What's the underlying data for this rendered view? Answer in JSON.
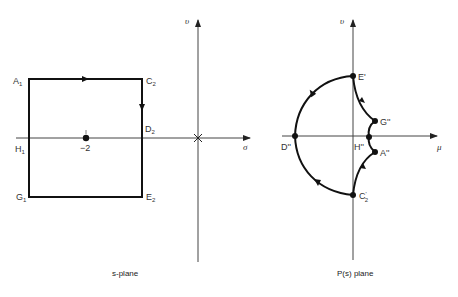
{
  "s_plane": {
    "caption": "s-plane",
    "axes": {
      "horizontal": "σ",
      "vertical": "υ"
    },
    "origin_marker": "×",
    "tick_label": "−2",
    "labels": {
      "A1": {
        "main": "A",
        "sub": "1"
      },
      "C2": {
        "main": "C",
        "sub": "2"
      },
      "D2": {
        "main": "D",
        "sub": "2"
      },
      "H1": {
        "main": "H",
        "sub": "1"
      },
      "G1": {
        "main": "G",
        "sub": "1"
      },
      "E2": {
        "main": "E",
        "sub": "2"
      }
    }
  },
  "p_plane": {
    "caption": "P(s) plane",
    "axes": {
      "horizontal": "μ",
      "vertical": "υ"
    },
    "labels": {
      "E": "E'",
      "G": "G''",
      "H": "H''",
      "A": "A''",
      "D": "D''",
      "C": {
        "main": "C",
        "prime": "'",
        "sub": "2"
      }
    }
  }
}
